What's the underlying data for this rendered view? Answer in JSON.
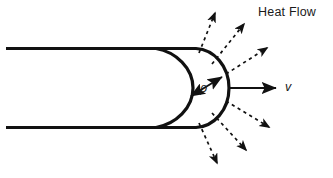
{
  "diagram": {
    "title_label": "Heat Flow",
    "velocity_label": "v",
    "radius_label": "ρ",
    "colors": {
      "stroke": "#111111",
      "background": "#ffffff",
      "text": "#1a1a1a"
    },
    "body": {
      "name": "blunt-body-nose",
      "top_wall_y": 48,
      "bottom_wall_y": 128,
      "wall_start_x": 6,
      "top_wall_end_x": 196,
      "inner_curve_start_x": 155,
      "outer_nose_tip_x": 229,
      "inner_nose_tip_x": 193,
      "axis_y": 88
    },
    "velocity_arrow": {
      "name": "velocity-vector",
      "x1": 230,
      "y1": 88,
      "x2": 279,
      "y2": 88
    },
    "radius_arrow": {
      "name": "radius-double-arrow",
      "x1": 189,
      "y1": 97,
      "x2": 224,
      "y2": 76
    },
    "heat_flow_arrows": [
      {
        "name": "heat-arrow-up-1",
        "x1": 199,
        "y1": 53,
        "x2": 217,
        "y2": 9
      },
      {
        "name": "heat-arrow-up-2",
        "x1": 213,
        "y1": 63,
        "x2": 247,
        "y2": 21
      },
      {
        "name": "heat-arrow-up-3",
        "x1": 226,
        "y1": 74,
        "x2": 270,
        "y2": 46
      },
      {
        "name": "heat-arrow-down-1",
        "x1": 226,
        "y1": 101,
        "x2": 273,
        "y2": 129
      },
      {
        "name": "heat-arrow-down-2",
        "x1": 213,
        "y1": 114,
        "x2": 249,
        "y2": 153
      },
      {
        "name": "heat-arrow-down-3",
        "x1": 200,
        "y1": 124,
        "x2": 219,
        "y2": 167
      }
    ]
  }
}
